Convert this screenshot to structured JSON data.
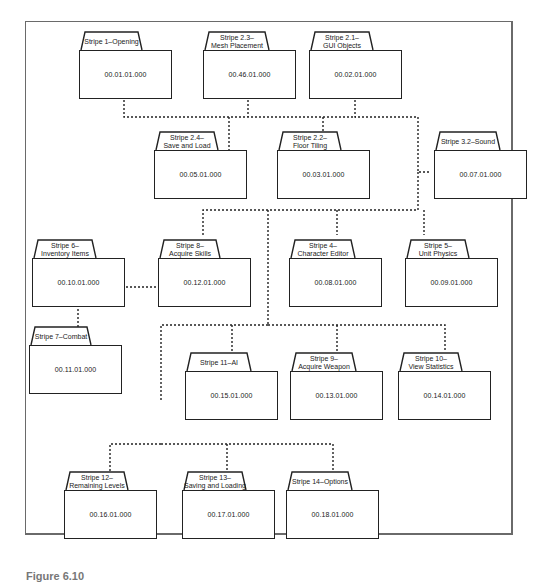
{
  "diagram": {
    "type": "package dependency diagram",
    "packages": [
      {
        "id": "p1",
        "label": "Stripe 1–Opening",
        "code": "00.01.01.000"
      },
      {
        "id": "p23",
        "label": "Stripe 2.3–\nMesh Placement",
        "code": "00.46.01.000"
      },
      {
        "id": "p21",
        "label": "Stripe 2.1–\nGUI Objects",
        "code": "00.02.01.000"
      },
      {
        "id": "p24",
        "label": "Stripe 2.4–\nSave and Load",
        "code": "00.05.01.000"
      },
      {
        "id": "p22",
        "label": "Stripe 2.2–\nFloor Tiling",
        "code": "00.03.01.000"
      },
      {
        "id": "p32",
        "label": "Stripe 3.2–Sound",
        "code": "00.07.01.000"
      },
      {
        "id": "p6",
        "label": "Stripe 6–\nInventory Items",
        "code": "00.10.01.000"
      },
      {
        "id": "p8",
        "label": "Stripe 8–\nAcquire Skills",
        "code": "00.12.01.000"
      },
      {
        "id": "p4",
        "label": "Stripe 4–\nCharacter Editor",
        "code": "00.08.01.000"
      },
      {
        "id": "p5",
        "label": "Stripe 5–\nUnit Physics",
        "code": "00.09.01.000"
      },
      {
        "id": "p7",
        "label": "Stripe 7–Combat",
        "code": "00.11.01.000"
      },
      {
        "id": "p11",
        "label": "Stripe 11–AI",
        "code": "00.15.01.000"
      },
      {
        "id": "p9",
        "label": "Stripe 9–\nAcquire Weapon",
        "code": "00.13.01.000"
      },
      {
        "id": "p10",
        "label": "Stripe 10–\nView Statistics",
        "code": "00.14.01.000"
      },
      {
        "id": "p12",
        "label": "Stripe 12–\nRemaining Levels",
        "code": "00.16.01.000"
      },
      {
        "id": "p13",
        "label": "Stripe 13–\nSaving and Loading",
        "code": "00.17.01.000"
      },
      {
        "id": "p14",
        "label": "Stripe 14–Options",
        "code": "00.18.01.000"
      }
    ],
    "connector_style": "dotted",
    "colors": {
      "line": "#222222",
      "frame": "#6a6a6a",
      "background": "#ffffff"
    }
  },
  "caption": {
    "text": "Figure 6.10"
  }
}
